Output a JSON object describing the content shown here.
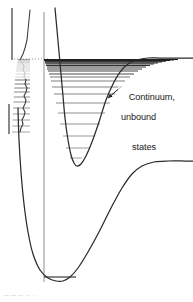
{
  "figure": {
    "kind": "molecular-potential-energy-diagram",
    "background_color": "#ffffff",
    "curve_color": "#2b2b2b",
    "level_color": "#555555",
    "dense_level_color": "#1f1f1f",
    "transition_line_color": "#9a9a9a",
    "axis_color": "#4a4a4a",
    "dotted_color": "#8a8a8a",
    "text_color": "#1a1a1a"
  },
  "annotations": {
    "diffuse_region": "Diffuse\nregion",
    "continuum_line1": "Continuum,",
    "continuum_line2": "unbound",
    "continuum_line3": "states",
    "bottom_caption": "— — —  – · ·"
  },
  "chart_data": {
    "type": "line",
    "title": "",
    "xlabel": "",
    "ylabel": "",
    "grid": false,
    "legend": null,
    "series": [
      {
        "name": "excited-state-potential",
        "comment": "Upper Morse curve: steep repulsive wall, minimum near x=76 y=166, rises to dissociation plateau at right y=59",
        "points": [
          [
            55,
            8
          ],
          [
            57,
            30
          ],
          [
            59,
            52
          ],
          [
            61,
            74
          ],
          [
            63,
            96
          ],
          [
            65,
            118
          ],
          [
            68,
            140
          ],
          [
            71,
            155
          ],
          [
            74,
            163
          ],
          [
            77,
            166
          ],
          [
            81,
            164
          ],
          [
            86,
            156
          ],
          [
            92,
            142
          ],
          [
            99,
            122
          ],
          [
            106,
            100
          ],
          [
            113,
            84
          ],
          [
            120,
            72
          ],
          [
            128,
            64
          ],
          [
            137,
            60
          ],
          [
            148,
            58
          ],
          [
            160,
            58
          ],
          [
            175,
            58
          ],
          [
            193,
            58
          ]
        ]
      },
      {
        "name": "ground-state-potential",
        "comment": "Lower Morse curve: wall at left x=20, minimum near x=62 y=280, rises to plateau at right y=162",
        "points": [
          [
            18,
            108
          ],
          [
            19,
            140
          ],
          [
            21,
            172
          ],
          [
            24,
            204
          ],
          [
            28,
            232
          ],
          [
            33,
            254
          ],
          [
            40,
            270
          ],
          [
            48,
            278
          ],
          [
            56,
            281
          ],
          [
            63,
            281
          ],
          [
            70,
            277
          ],
          [
            78,
            268
          ],
          [
            88,
            252
          ],
          [
            99,
            232
          ],
          [
            111,
            208
          ],
          [
            122,
            188
          ],
          [
            132,
            174
          ],
          [
            142,
            166
          ],
          [
            154,
            162
          ],
          [
            168,
            161
          ],
          [
            185,
            161
          ],
          [
            193,
            161
          ]
        ]
      },
      {
        "name": "absorption-spectrum-trace",
        "comment": "Left-hand spectrum profile: sharp continuum edge at top, wavy discrete band structure below",
        "points": [
          [
            30,
            10
          ],
          [
            29,
            20
          ],
          [
            28,
            30
          ],
          [
            27,
            40
          ],
          [
            25,
            48
          ],
          [
            23,
            54
          ],
          [
            21,
            58
          ],
          [
            20,
            60
          ],
          [
            22,
            63
          ],
          [
            24,
            66
          ],
          [
            23,
            70
          ],
          [
            25,
            73
          ],
          [
            24,
            77
          ],
          [
            26,
            80
          ],
          [
            25,
            84
          ],
          [
            27,
            88
          ],
          [
            26,
            92
          ],
          [
            24,
            96
          ],
          [
            26,
            100
          ],
          [
            25,
            104
          ],
          [
            23,
            108
          ],
          [
            25,
            112
          ],
          [
            24,
            116
          ],
          [
            22,
            120
          ],
          [
            23,
            124
          ],
          [
            21,
            128
          ],
          [
            20,
            132
          ]
        ]
      }
    ],
    "vibrational_levels_upper": {
      "comment": "Horizontal level lines inside upper well, converging (Morse-like spacing) toward dissociation limit y=59",
      "levels": [
        {
          "y": 158,
          "x0": 70,
          "x1": 82
        },
        {
          "y": 148,
          "x0": 66,
          "x1": 89
        },
        {
          "y": 136,
          "x0": 63,
          "x1": 95
        },
        {
          "y": 124,
          "x0": 60,
          "x1": 100
        },
        {
          "y": 113,
          "x0": 58,
          "x1": 105
        },
        {
          "y": 103,
          "x0": 56,
          "x1": 110
        },
        {
          "y": 94,
          "x0": 54,
          "x1": 115
        },
        {
          "y": 87,
          "x0": 52,
          "x1": 120
        },
        {
          "y": 81,
          "x0": 51,
          "x1": 125
        },
        {
          "y": 77,
          "x0": 50,
          "x1": 130
        },
        {
          "y": 74,
          "x0": 49,
          "x1": 134
        },
        {
          "y": 71,
          "x0": 48,
          "x1": 138
        },
        {
          "y": 69,
          "x0": 47,
          "x1": 142
        },
        {
          "y": 67,
          "x0": 47,
          "x1": 146
        },
        {
          "y": 65.5,
          "x0": 46,
          "x1": 150
        },
        {
          "y": 64,
          "x0": 46,
          "x1": 154
        },
        {
          "y": 63,
          "x0": 45,
          "x1": 158
        },
        {
          "y": 62,
          "x0": 45,
          "x1": 162
        },
        {
          "y": 61.2,
          "x0": 45,
          "x1": 166
        },
        {
          "y": 60.5,
          "x0": 44,
          "x1": 170
        },
        {
          "y": 60,
          "x0": 44,
          "x1": 174
        },
        {
          "y": 59.5,
          "x0": 44,
          "x1": 178
        }
      ]
    },
    "vibrational_levels_lower": {
      "comment": "Ground state: single lowest vibrational level drawn across well minimum",
      "levels": [
        {
          "y": 277,
          "x0": 44,
          "x1": 76
        }
      ]
    },
    "spectrum_lines": {
      "comment": "Discrete absorption lines at left, spacing narrowing upward into the diffuse/continuum region",
      "y_values": [
        132,
        126,
        120,
        114,
        108,
        102,
        97,
        92,
        88,
        84,
        80,
        77,
        74,
        71,
        69,
        67,
        65,
        63,
        62,
        61,
        60
      ],
      "x0": 12,
      "x1": 30
    },
    "dissociation_limit": {
      "comment": "Dotted horizontal line marking dissociation / continuum onset",
      "y": 59,
      "x0": 14,
      "x1": 48
    },
    "transition_arrow": {
      "comment": "Vertical grey Franck-Condon transition line from ground level up through excited well",
      "x": 44,
      "y0": 12,
      "y1": 282
    },
    "pointer_arrow": {
      "comment": "Small arrow from Continuum label toward the dense level stack",
      "from": [
        122,
        86
      ],
      "to": [
        108,
        98
      ]
    }
  }
}
